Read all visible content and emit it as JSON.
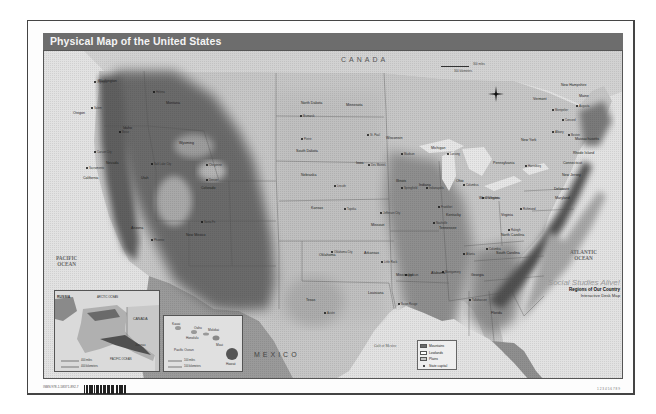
{
  "title": "Physical Map of the United States",
  "countries": {
    "canada": "CANADA",
    "mexico": "MEXICO"
  },
  "oceans": {
    "pacific": "PACIFIC OCEAN",
    "atlantic": "ATLANTIC OCEAN",
    "gulf": "Gulf of Mexico"
  },
  "scale": {
    "miles": "300 miles",
    "kilometers": "300 kilometers"
  },
  "state_labels": [
    {
      "name": "Washington",
      "x": 97,
      "y": 78
    },
    {
      "name": "Oregon",
      "x": 72,
      "y": 110
    },
    {
      "name": "California",
      "x": 82,
      "y": 175
    },
    {
      "name": "Idaho",
      "x": 122,
      "y": 125
    },
    {
      "name": "Nevada",
      "x": 105,
      "y": 160
    },
    {
      "name": "Montana",
      "x": 165,
      "y": 100
    },
    {
      "name": "Wyoming",
      "x": 178,
      "y": 140
    },
    {
      "name": "Utah",
      "x": 140,
      "y": 175
    },
    {
      "name": "Colorado",
      "x": 200,
      "y": 185
    },
    {
      "name": "Arizona",
      "x": 130,
      "y": 225
    },
    {
      "name": "New Mexico",
      "x": 185,
      "y": 232
    },
    {
      "name": "North Dakota",
      "x": 300,
      "y": 100
    },
    {
      "name": "South Dakota",
      "x": 295,
      "y": 148
    },
    {
      "name": "Nebraska",
      "x": 300,
      "y": 172
    },
    {
      "name": "Kansas",
      "x": 310,
      "y": 205
    },
    {
      "name": "Oklahoma",
      "x": 318,
      "y": 252
    },
    {
      "name": "Texas",
      "x": 305,
      "y": 297
    },
    {
      "name": "Minnesota",
      "x": 345,
      "y": 102
    },
    {
      "name": "Iowa",
      "x": 355,
      "y": 160
    },
    {
      "name": "Missouri",
      "x": 370,
      "y": 222
    },
    {
      "name": "Arkansas",
      "x": 363,
      "y": 250
    },
    {
      "name": "Louisiana",
      "x": 367,
      "y": 290
    },
    {
      "name": "Wisconsin",
      "x": 385,
      "y": 135
    },
    {
      "name": "Michigan",
      "x": 430,
      "y": 145
    },
    {
      "name": "Illinois",
      "x": 395,
      "y": 178
    },
    {
      "name": "Indiana",
      "x": 418,
      "y": 182
    },
    {
      "name": "Ohio",
      "x": 455,
      "y": 178
    },
    {
      "name": "Kentucky",
      "x": 445,
      "y": 212
    },
    {
      "name": "Tennessee",
      "x": 438,
      "y": 225
    },
    {
      "name": "Mississippi",
      "x": 395,
      "y": 272
    },
    {
      "name": "Alabama",
      "x": 430,
      "y": 270
    },
    {
      "name": "Georgia",
      "x": 470,
      "y": 272
    },
    {
      "name": "South Carolina",
      "x": 495,
      "y": 250
    },
    {
      "name": "North Carolina",
      "x": 500,
      "y": 232
    },
    {
      "name": "Virginia",
      "x": 500,
      "y": 212
    },
    {
      "name": "West Virginia",
      "x": 478,
      "y": 195
    },
    {
      "name": "Pennsylvania",
      "x": 492,
      "y": 160
    },
    {
      "name": "New York",
      "x": 520,
      "y": 137
    },
    {
      "name": "Vermont",
      "x": 532,
      "y": 96
    },
    {
      "name": "New Hampshire",
      "x": 560,
      "y": 82
    },
    {
      "name": "Maine",
      "x": 578,
      "y": 93
    },
    {
      "name": "Massachusetts",
      "x": 574,
      "y": 136
    },
    {
      "name": "Rhode Island",
      "x": 572,
      "y": 150
    },
    {
      "name": "Connecticut",
      "x": 562,
      "y": 160
    },
    {
      "name": "New Jersey",
      "x": 561,
      "y": 172
    },
    {
      "name": "Delaware",
      "x": 553,
      "y": 186
    },
    {
      "name": "Maryland",
      "x": 554,
      "y": 195
    },
    {
      "name": "Florida",
      "x": 490,
      "y": 310
    }
  ],
  "capitals": [
    {
      "name": "Olympia",
      "x": 93,
      "y": 80
    },
    {
      "name": "Salem",
      "x": 90,
      "y": 106
    },
    {
      "name": "Boise",
      "x": 118,
      "y": 130
    },
    {
      "name": "Helena",
      "x": 152,
      "y": 90
    },
    {
      "name": "Carson City",
      "x": 93,
      "y": 150
    },
    {
      "name": "Sacramento",
      "x": 85,
      "y": 166
    },
    {
      "name": "Salt Lake City",
      "x": 150,
      "y": 162
    },
    {
      "name": "Cheyenne",
      "x": 205,
      "y": 163
    },
    {
      "name": "Denver",
      "x": 205,
      "y": 178
    },
    {
      "name": "Phoenix",
      "x": 150,
      "y": 238
    },
    {
      "name": "Santa Fe",
      "x": 200,
      "y": 220
    },
    {
      "name": "Bismarck",
      "x": 299,
      "y": 114
    },
    {
      "name": "Pierre",
      "x": 300,
      "y": 137
    },
    {
      "name": "Lincoln",
      "x": 333,
      "y": 184
    },
    {
      "name": "Topeka",
      "x": 343,
      "y": 207
    },
    {
      "name": "Oklahoma City",
      "x": 330,
      "y": 250
    },
    {
      "name": "Austin",
      "x": 323,
      "y": 311
    },
    {
      "name": "St. Paul",
      "x": 366,
      "y": 133
    },
    {
      "name": "Des Moines",
      "x": 367,
      "y": 163
    },
    {
      "name": "Jefferson City",
      "x": 379,
      "y": 211
    },
    {
      "name": "Little Rock",
      "x": 380,
      "y": 260
    },
    {
      "name": "Baton Rouge",
      "x": 397,
      "y": 302
    },
    {
      "name": "Madison",
      "x": 400,
      "y": 152
    },
    {
      "name": "Lansing",
      "x": 446,
      "y": 152
    },
    {
      "name": "Springfield",
      "x": 400,
      "y": 186
    },
    {
      "name": "Indianapolis",
      "x": 425,
      "y": 186
    },
    {
      "name": "Columbus",
      "x": 462,
      "y": 183
    },
    {
      "name": "Frankfort",
      "x": 437,
      "y": 205
    },
    {
      "name": "Nashville",
      "x": 432,
      "y": 221
    },
    {
      "name": "Jackson",
      "x": 404,
      "y": 273
    },
    {
      "name": "Montgomery",
      "x": 441,
      "y": 270
    },
    {
      "name": "Atlanta",
      "x": 462,
      "y": 252
    },
    {
      "name": "Columbia",
      "x": 485,
      "y": 247
    },
    {
      "name": "Raleigh",
      "x": 507,
      "y": 228
    },
    {
      "name": "Richmond",
      "x": 519,
      "y": 207
    },
    {
      "name": "Charleston",
      "x": 481,
      "y": 196
    },
    {
      "name": "Harrisburg",
      "x": 524,
      "y": 164
    },
    {
      "name": "Albany",
      "x": 551,
      "y": 130
    },
    {
      "name": "Montpelier",
      "x": 551,
      "y": 108
    },
    {
      "name": "Concord",
      "x": 561,
      "y": 118
    },
    {
      "name": "Augusta",
      "x": 575,
      "y": 104
    },
    {
      "name": "Boston",
      "x": 567,
      "y": 133
    },
    {
      "name": "Tallahassee",
      "x": 468,
      "y": 298
    }
  ],
  "insets": {
    "alaska": {
      "labels": [
        "RUSSIA",
        "CANADA",
        "ARCTIC OCEAN",
        "PACIFIC OCEAN",
        "Juneau"
      ],
      "scale": [
        "400 miles",
        "400 kilometers"
      ]
    },
    "hawaii": {
      "labels": [
        "Honolulu",
        "Kauai",
        "Oahu",
        "Molokai",
        "Maui",
        "Hawaii",
        "Pacific Ocean"
      ],
      "scale": [
        "100 miles",
        "100 kilometers"
      ]
    }
  },
  "legend": {
    "items": [
      {
        "label": "Mountains",
        "color": "#6a6a6a"
      },
      {
        "label": "Lowlands",
        "color": "#ffffff"
      },
      {
        "label": "Plains",
        "color": "#c4c4c4"
      },
      {
        "label": "State capital",
        "color": "#111111"
      }
    ]
  },
  "branding": {
    "series": "Social Studies Alive!",
    "subtitle": "Regions of Our Country",
    "product": "Interactive Desk Map"
  },
  "footer": {
    "catalog": "ISBN 978-1-58371-892-7",
    "page_code": "1 2 3 4 5 6 7 8 9"
  },
  "colors": {
    "title_band": "#6d6d6d",
    "mountains": "#6a6a6a",
    "plains": "#c4c4c4",
    "water": "#e4e4e4"
  }
}
